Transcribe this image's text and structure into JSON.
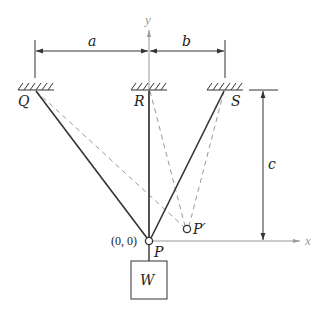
{
  "diagram": {
    "type": "mechanics-cable-suspension",
    "axes": {
      "x_label": "x",
      "y_label": "y"
    },
    "origin_label": "(0, 0)",
    "supports": [
      {
        "id": "Q",
        "label": "Q"
      },
      {
        "id": "R",
        "label": "R"
      },
      {
        "id": "S",
        "label": "S"
      }
    ],
    "points": {
      "P": {
        "label": "P"
      },
      "P_prime": {
        "label": "P′"
      }
    },
    "dimensions": {
      "a": "a",
      "b": "b",
      "c": "c"
    },
    "weight": {
      "label": "W"
    },
    "colors": {
      "solid_line": "#333333",
      "dashed_line": "#999999",
      "axis": "#999999",
      "dimension": "#333333"
    }
  }
}
